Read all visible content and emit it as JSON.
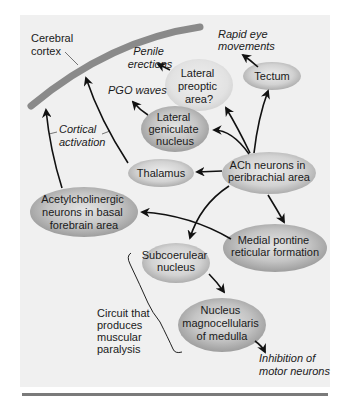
{
  "diagram": {
    "colors": {
      "panel_bg": "#f0f0f0",
      "cortex_band": "#8a8a8a",
      "bottom_rule": "#7a7a7a",
      "ellipse_center": "#e6e6e6",
      "ellipse_edge": "#a8a8a8",
      "arrow": "#111111"
    },
    "cortex_label": [
      "Cerebral",
      "cortex"
    ],
    "cortical_activation_label": [
      "Cortical",
      "activation"
    ],
    "nodes": {
      "lateral_preoptic": [
        "Lateral",
        "preoptic",
        "area?"
      ],
      "tectum": [
        "Tectum"
      ],
      "lateral_geniculate": [
        "Lateral",
        "geniculate",
        "nucleus"
      ],
      "thalamus": [
        "Thalamus"
      ],
      "ach_peribrachial": [
        "ACh neurons in",
        "peribrachial area"
      ],
      "basal_forebrain": [
        "Acetylcholinergic",
        "neurons in basal",
        "forebrain area"
      ],
      "medial_pontine": [
        "Medial pontine",
        "reticular formation"
      ],
      "subcoerulear": [
        "Subcoerulear",
        "nucleus"
      ],
      "magnocellularis": [
        "Nucleus",
        "magnocellularis",
        "of medulla"
      ]
    },
    "outcomes": {
      "penile_erections": [
        "Penile",
        "erections"
      ],
      "rapid_eye_movements": [
        "Rapid eye",
        "movements"
      ],
      "pgo_waves": [
        "PGO waves"
      ],
      "inhibition_motor": [
        "Inhibition of",
        "motor neurons"
      ]
    },
    "circuit_label": [
      "Circuit that",
      "produces",
      "muscular",
      "paralysis"
    ]
  }
}
